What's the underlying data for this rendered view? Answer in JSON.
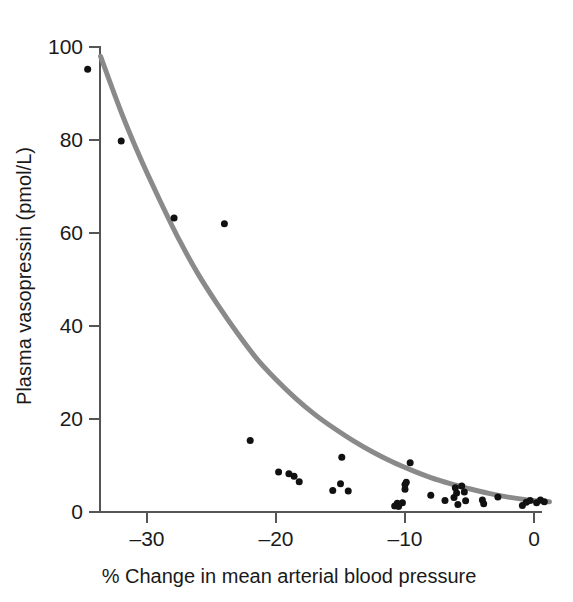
{
  "chart_data": {
    "type": "scatter",
    "title": "",
    "subtitle": "",
    "xlabel": "% Change in mean arterial blood pressure",
    "ylabel": "Plasma vasopressin (pmol/L)",
    "xlim": [
      -34.8,
      1.5
    ],
    "ylim": [
      0,
      102
    ],
    "xticks": [
      -30,
      -20,
      -10,
      0
    ],
    "xtick_labels": [
      "–30",
      "–20",
      "–10",
      "0"
    ],
    "yticks": [
      0,
      20,
      40,
      60,
      80,
      100
    ],
    "ytick_labels": [
      "0",
      "20",
      "40",
      "60",
      "80",
      "100"
    ],
    "grid": false,
    "legend": "none",
    "point_color": "#111111",
    "point_size": 7,
    "curve_color": "#8a8a8a",
    "curve_width": 5,
    "axis_color": "#555555",
    "series": [
      {
        "name": "Observations",
        "marker": "filled-circle",
        "points": [
          [
            -34.6,
            95.2
          ],
          [
            -32.0,
            79.8
          ],
          [
            -27.9,
            63.2
          ],
          [
            -24.0,
            62.0
          ],
          [
            -22.0,
            15.4
          ],
          [
            -19.8,
            8.6
          ],
          [
            -19.0,
            8.2
          ],
          [
            -18.6,
            7.7
          ],
          [
            -18.2,
            6.5
          ],
          [
            -15.6,
            4.6
          ],
          [
            -15.0,
            6.1
          ],
          [
            -14.9,
            11.8
          ],
          [
            -14.4,
            4.5
          ],
          [
            -10.8,
            1.3
          ],
          [
            -10.6,
            1.9
          ],
          [
            -10.5,
            1.2
          ],
          [
            -10.2,
            2.0
          ],
          [
            -10.0,
            5.9
          ],
          [
            -10.0,
            4.9
          ],
          [
            -9.9,
            6.4
          ],
          [
            -9.6,
            10.6
          ],
          [
            -8.0,
            3.6
          ],
          [
            -6.9,
            2.5
          ],
          [
            -6.2,
            3.1
          ],
          [
            -6.1,
            5.2
          ],
          [
            -6.0,
            4.1
          ],
          [
            -5.9,
            1.6
          ],
          [
            -5.6,
            5.6
          ],
          [
            -5.4,
            4.3
          ],
          [
            -5.3,
            2.4
          ],
          [
            -4.0,
            2.6
          ],
          [
            -3.9,
            1.8
          ],
          [
            -2.8,
            3.2
          ],
          [
            -0.9,
            1.4
          ],
          [
            -0.6,
            2.1
          ],
          [
            -0.3,
            2.5
          ],
          [
            0.2,
            2.0
          ],
          [
            0.5,
            2.6
          ],
          [
            0.8,
            2.2
          ]
        ]
      }
    ],
    "fit_curve": {
      "name": "Exponential fit",
      "description": "Monotonic exponential decay fitted through the observations",
      "points": [
        [
          -33.6,
          98.0
        ],
        [
          -32.0,
          86.0
        ],
        [
          -30.5,
          76.0
        ],
        [
          -29.0,
          67.0
        ],
        [
          -27.5,
          58.5
        ],
        [
          -26.0,
          51.0
        ],
        [
          -24.5,
          44.5
        ],
        [
          -23.0,
          38.5
        ],
        [
          -21.5,
          33.0
        ],
        [
          -20.0,
          28.5
        ],
        [
          -18.5,
          24.5
        ],
        [
          -17.0,
          21.0
        ],
        [
          -15.5,
          18.0
        ],
        [
          -14.0,
          15.3
        ],
        [
          -12.5,
          12.9
        ],
        [
          -11.0,
          10.8
        ],
        [
          -9.5,
          9.0
        ],
        [
          -8.0,
          7.4
        ],
        [
          -6.5,
          6.1
        ],
        [
          -5.0,
          5.0
        ],
        [
          -3.5,
          4.0
        ],
        [
          -2.0,
          3.2
        ],
        [
          -0.5,
          2.6
        ],
        [
          1.2,
          2.2
        ]
      ]
    }
  }
}
